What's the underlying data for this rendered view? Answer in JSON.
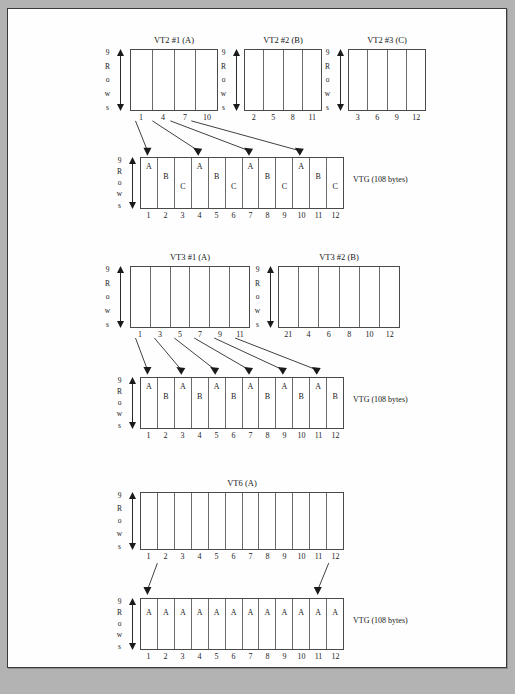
{
  "page": {
    "background_color": "#b3b3b3",
    "sheet_color": "#fefefe",
    "border_color": "#3a3a3a"
  },
  "row_caption": {
    "chars": [
      "9",
      "R",
      "o",
      "w",
      "s"
    ],
    "text": "9 Rows"
  },
  "vtg_caption": "VTG (108 bytes)",
  "sections": [
    {
      "id": "vt2",
      "sources": [
        {
          "title": "VT2 #1 (A)",
          "numbers": [
            "1",
            "4",
            "7",
            "10"
          ]
        },
        {
          "title": "VT2 #2 (B)",
          "numbers": [
            "2",
            "5",
            "8",
            "11"
          ]
        },
        {
          "title": "VT2 #3 (C)",
          "numbers": [
            "3",
            "6",
            "9",
            "12"
          ]
        }
      ],
      "vtg": {
        "caption": "VTG (108 bytes)",
        "numbers": [
          "1",
          "2",
          "3",
          "4",
          "5",
          "6",
          "7",
          "8",
          "9",
          "10",
          "11",
          "12"
        ],
        "letters": [
          "A",
          "B",
          "C",
          "A",
          "B",
          "C",
          "A",
          "B",
          "C",
          "A",
          "B",
          "C"
        ],
        "levels": [
          "l1",
          "l2",
          "l3",
          "l1",
          "l2",
          "l3",
          "l1",
          "l2",
          "l3",
          "l1",
          "l2",
          "l3"
        ]
      },
      "mapping_label": "arrows from VT2 #1 (A) columns 1,4,7,10 to VTG cells 1,4,7,10"
    },
    {
      "id": "vt3",
      "sources": [
        {
          "title": "VT3 #1 (A)",
          "numbers": [
            "1",
            "3",
            "5",
            "7",
            "9",
            "11"
          ]
        },
        {
          "title": "VT3 #2 (B)",
          "numbers": [
            "21",
            "4",
            "6",
            "8",
            "10",
            "12"
          ]
        }
      ],
      "vtg": {
        "caption": "VTG (108 bytes)",
        "numbers": [
          "1",
          "2",
          "3",
          "4",
          "5",
          "6",
          "7",
          "8",
          "9",
          "10",
          "11",
          "12"
        ],
        "letters": [
          "A",
          "B",
          "A",
          "B",
          "A",
          "B",
          "A",
          "B",
          "A",
          "B",
          "A",
          "B"
        ],
        "levels": [
          "l1",
          "l2",
          "l1",
          "l2",
          "l1",
          "l2",
          "l1",
          "l2",
          "l1",
          "l2",
          "l1",
          "l2"
        ]
      },
      "mapping_label": "arrows from VT3 #1 (A) columns 1,3,5,7,9,11 to VTG cells 1,3,5,7,9,11"
    },
    {
      "id": "vt6",
      "sources": [
        {
          "title": "VT6 (A)",
          "numbers": [
            "1",
            "2",
            "3",
            "4",
            "5",
            "6",
            "7",
            "8",
            "9",
            "10",
            "11",
            "12"
          ]
        }
      ],
      "vtg": {
        "caption": "VTG (108 bytes)",
        "numbers": [
          "1",
          "2",
          "3",
          "4",
          "5",
          "6",
          "7",
          "8",
          "9",
          "10",
          "11",
          "12"
        ],
        "letters": [
          "A",
          "A",
          "A",
          "A",
          "A",
          "A",
          "A",
          "A",
          "A",
          "A",
          "A",
          "A"
        ],
        "levels": [
          "lflat",
          "lflat",
          "lflat",
          "lflat",
          "lflat",
          "lflat",
          "lflat",
          "lflat",
          "lflat",
          "lflat",
          "lflat",
          "lflat"
        ]
      },
      "mapping_label": "arrows from VT6 (A) columns 1 and 12 to VTG cells 1 and 12"
    }
  ]
}
